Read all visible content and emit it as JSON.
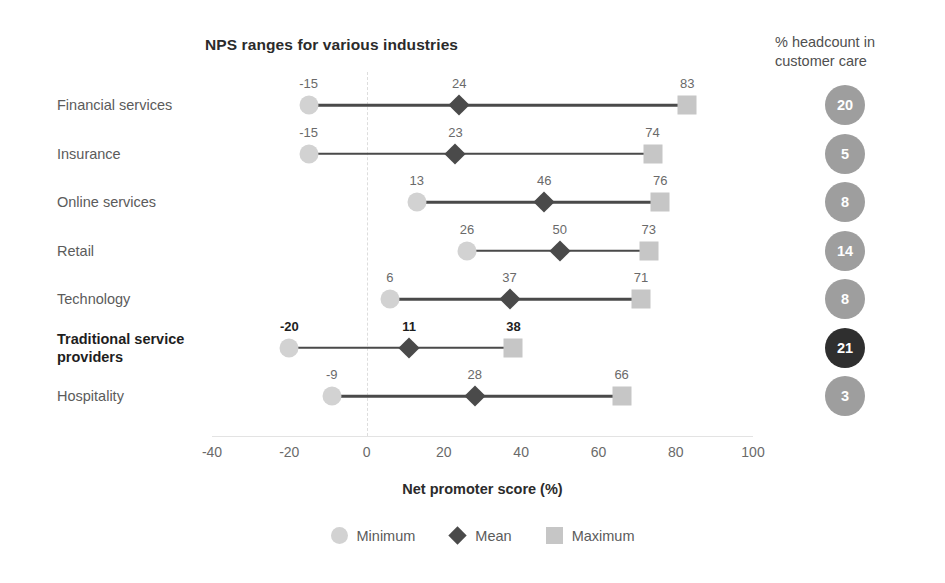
{
  "chart_data": {
    "type": "bar",
    "subtype": "range-dumbbell",
    "title": "NPS ranges for various industries",
    "xlabel": "Net promoter score (%)",
    "ylabel": "",
    "xlim": [
      -40,
      100
    ],
    "xticks": [
      -40,
      -20,
      0,
      20,
      40,
      60,
      80,
      100
    ],
    "xtick_labels": [
      "-40",
      "-20",
      "0",
      "20",
      "40",
      "60",
      "80",
      "100"
    ],
    "grid": "vertical-dashed-at-zero",
    "legend_position": "bottom-center",
    "categories": [
      "Financial services",
      "Insurance",
      "Online services",
      "Retail",
      "Technology",
      "Traditional service providers",
      "Hospitality"
    ],
    "series": [
      {
        "name": "Minimum",
        "marker": "circle",
        "color": "#d2d2d2",
        "values": [
          -15,
          -15,
          13,
          26,
          6,
          -20,
          -9
        ]
      },
      {
        "name": "Mean",
        "marker": "diamond",
        "color": "#4a4a4a",
        "values": [
          24,
          23,
          46,
          50,
          37,
          11,
          28
        ]
      },
      {
        "name": "Maximum",
        "marker": "square",
        "color": "#c6c6c6",
        "values": [
          83,
          74,
          76,
          73,
          71,
          38,
          66
        ]
      }
    ],
    "highlighted_category": "Traditional service providers",
    "side_panel": {
      "title": "% headcount in customer care",
      "values": [
        20,
        5,
        8,
        14,
        8,
        21,
        3
      ],
      "highlighted_index": 5
    }
  },
  "rows": [
    {
      "label": "Financial services",
      "highlight": false,
      "min": -15,
      "mean": 24,
      "max": 83,
      "min_label": "-15",
      "mean_label": "24",
      "max_label": "83",
      "headcount": "20"
    },
    {
      "label": "Insurance",
      "highlight": false,
      "min": -15,
      "mean": 23,
      "max": 74,
      "min_label": "-15",
      "mean_label": "23",
      "max_label": "74",
      "headcount": "5"
    },
    {
      "label": "Online services",
      "highlight": false,
      "min": 13,
      "mean": 46,
      "max": 76,
      "min_label": "13",
      "mean_label": "46",
      "max_label": "76",
      "headcount": "8"
    },
    {
      "label": "Retail",
      "highlight": false,
      "min": 26,
      "mean": 50,
      "max": 73,
      "min_label": "26",
      "mean_label": "50",
      "max_label": "73",
      "headcount": "14"
    },
    {
      "label": "Technology",
      "highlight": false,
      "min": 6,
      "mean": 37,
      "max": 71,
      "min_label": "6",
      "mean_label": "37",
      "max_label": "71",
      "headcount": "8"
    },
    {
      "label": "Traditional service providers",
      "highlight": true,
      "min": -20,
      "mean": 11,
      "max": 38,
      "min_label": "-20",
      "mean_label": "11",
      "max_label": "38",
      "headcount": "21"
    },
    {
      "label": "Hospitality",
      "highlight": false,
      "min": -9,
      "mean": 28,
      "max": 66,
      "min_label": "-9",
      "mean_label": "28",
      "max_label": "66",
      "headcount": "3"
    }
  ],
  "header": {
    "chart_title": "NPS ranges for various industries",
    "headcount_title": "% headcount in customer care"
  },
  "axis": {
    "title": "Net promoter score (%)",
    "ticks": [
      "-40",
      "-20",
      "0",
      "20",
      "40",
      "60",
      "80",
      "100"
    ]
  },
  "legend": [
    {
      "label": "Minimum",
      "shape": "circle-icon"
    },
    {
      "label": "Mean",
      "shape": "diamond-icon"
    },
    {
      "label": "Maximum",
      "shape": "square-icon"
    }
  ],
  "colors": {
    "min": "#d2d2d2",
    "mean": "#4a4a4a",
    "max": "#c6c6c6",
    "bubble": "#9e9e9e",
    "bubble_highlight": "#2f2f2f",
    "text": "#5b5b5b",
    "text_dark": "#1e1e1e"
  }
}
